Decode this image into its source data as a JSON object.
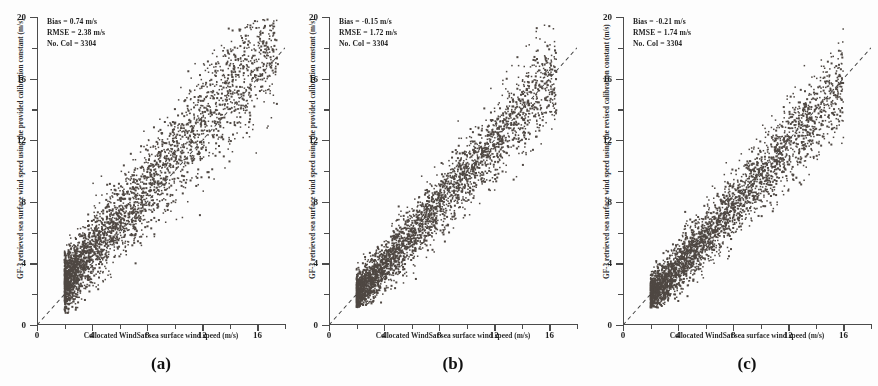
{
  "figure": {
    "background": "#fdfdfd",
    "point_color": "#4f4843",
    "axis_color": "#4b4b4b"
  },
  "panels": [
    {
      "key": "a",
      "label": "(a)",
      "xlabel": "Collocated WindSat sea surface wind speed (m/s)",
      "ylabel": "GF-3 retrieved sea surface wind speed using the provided calibration constant (m/s)",
      "stats": {
        "bias": "Bias = 0.74 m/s",
        "rmse": "RMSE = 2.38 m/s",
        "count": "No. Col = 3304"
      }
    },
    {
      "key": "b",
      "label": "(b)",
      "xlabel": "Collocated WindSat sea surface wind speed (m/s)",
      "ylabel": "GF-3 retrieved sea surface wind speed using the provided calibration constant (m/s)",
      "stats": {
        "bias": "Bias = -0.15 m/s",
        "rmse": "RMSE = 1.72 m/s",
        "count": "No. Col = 3304"
      }
    },
    {
      "key": "c",
      "label": "(c)",
      "xlabel": "Collocated WindSat sea surface wind speed (m/s)",
      "ylabel": "GF-3 retrieved sea surface wind speed using the revised calibration constant (m/s)",
      "stats": {
        "bias": "Bias = -0.21 m/s",
        "rmse": "RMSE = 1.74 m/s",
        "count": "No. Col = 3304"
      }
    }
  ],
  "axis_ticks": {
    "x_major": [
      0,
      4,
      8,
      12,
      16
    ],
    "x_minor": [
      2,
      6,
      10,
      14,
      18
    ],
    "y_major": [
      0,
      4,
      8,
      12,
      16,
      20
    ],
    "y_minor": [
      2,
      6,
      10,
      14,
      18
    ]
  },
  "chart_data": {
    "type": "scatter",
    "title": "",
    "panel_count": 3,
    "xlabel": "Collocated WindSat sea surface wind speed (m/s)",
    "xlim": [
      0,
      18
    ],
    "ylim": [
      0,
      20
    ],
    "grid": false,
    "legend": "none",
    "reference_line": {
      "type": "1:1 identity line",
      "style": "dashed",
      "from": [
        0,
        0
      ],
      "to": [
        18,
        18
      ]
    },
    "series": [
      {
        "name": "(a) provided calibration constant",
        "n_points": 3304,
        "bias_ms": 0.74,
        "rmse_ms": 2.38,
        "ylabel": "GF-3 retrieved sea surface wind speed using the provided calibration constant (m/s)",
        "x_range": [
          2.0,
          17.5
        ],
        "y_range": [
          1.0,
          20.0
        ],
        "slope": 1.05,
        "intercept": 0.6,
        "spread": 2.38,
        "seed": 17,
        "description": "Broad diffuse cloud, widely scattered about the 1:1 line, positive bias with many points above the identity line at high wind speeds"
      },
      {
        "name": "(b) provided calibration constant",
        "n_points": 3304,
        "bias_ms": -0.15,
        "rmse_ms": 1.72,
        "ylabel": "GF-3 retrieved sea surface wind speed using the provided calibration constant (m/s)",
        "x_range": [
          2.0,
          16.5
        ],
        "y_range": [
          1.5,
          16.5
        ],
        "slope": 1.0,
        "intercept": -0.15,
        "spread": 1.72,
        "seed": 43,
        "description": "Tighter elongated cloud hugging the 1:1 line, slight negative bias"
      },
      {
        "name": "(c) revised calibration constant",
        "n_points": 3304,
        "bias_ms": -0.21,
        "rmse_ms": 1.74,
        "ylabel": "GF-3 retrieved sea surface wind speed using the revised calibration constant (m/s)",
        "x_range": [
          2.0,
          16.0
        ],
        "y_range": [
          1.5,
          16.0
        ],
        "slope": 0.99,
        "intercept": -0.21,
        "spread": 1.74,
        "seed": 91,
        "description": "Tight cloud closely following the 1:1 line, slight negative bias"
      }
    ]
  }
}
